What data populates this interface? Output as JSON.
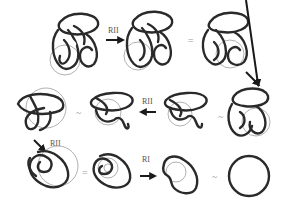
{
  "colors": {
    "strand": "#2a2a2a",
    "disk": "#a8a8a8",
    "arrow": "#1a1a1a",
    "text": "#555555"
  },
  "steps": [
    {
      "id": "d1",
      "label": "knot diagram 1"
    },
    {
      "id": "m1",
      "type": "arrow",
      "direction": "right",
      "move": "RII"
    },
    {
      "id": "d2",
      "label": "knot diagram 2"
    },
    {
      "id": "s1",
      "type": "equivalence",
      "symbol": "="
    },
    {
      "id": "d3",
      "label": "knot diagram 3"
    },
    {
      "id": "m2",
      "type": "arrow",
      "direction": "down-right",
      "move": ""
    },
    {
      "id": "d4",
      "label": "knot diagram 4"
    },
    {
      "id": "s2",
      "type": "equivalence",
      "symbol": "~"
    },
    {
      "id": "d5",
      "label": "knot diagram 5"
    },
    {
      "id": "m3",
      "type": "arrow",
      "direction": "left",
      "move": "RII"
    },
    {
      "id": "d6",
      "label": "knot diagram 6"
    },
    {
      "id": "s3",
      "type": "equivalence",
      "symbol": "~"
    },
    {
      "id": "d7",
      "label": "knot diagram 7"
    },
    {
      "id": "m4",
      "type": "arrow",
      "direction": "down-right",
      "move": "RII"
    },
    {
      "id": "d8",
      "label": "knot diagram 8"
    },
    {
      "id": "s4",
      "type": "equivalence",
      "symbol": "="
    },
    {
      "id": "d9",
      "label": "knot diagram 9"
    },
    {
      "id": "m5",
      "type": "arrow",
      "direction": "right",
      "move": "RI"
    },
    {
      "id": "d10",
      "label": "knot diagram 10"
    },
    {
      "id": "s5",
      "type": "equivalence",
      "symbol": "~"
    },
    {
      "id": "d11",
      "label": "unknot"
    }
  ],
  "labels": {
    "m1": "RII",
    "m3": "RII",
    "m4": "RII",
    "m5": "RI",
    "s1": "=",
    "s2": "~",
    "s3": "~",
    "s4": "=",
    "s5": "~"
  }
}
